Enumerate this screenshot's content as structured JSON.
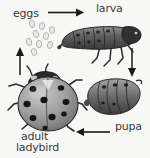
{
  "diagram": {
    "background_color": "#f7f7f5",
    "text_color": "#3a3a3a",
    "labels": {
      "eggs": "eggs",
      "larva": "larva",
      "pupa": "pupa",
      "adult_line1": "adult",
      "adult_line2": "ladybird"
    },
    "stages": [
      {
        "name": "eggs",
        "label": "eggs",
        "count": 9
      },
      {
        "name": "larva",
        "label": "larva"
      },
      {
        "name": "pupa",
        "label": "pupa"
      },
      {
        "name": "adult",
        "label": "adult ladybird"
      }
    ],
    "arrows": [
      {
        "name": "eggs-to-larva",
        "direction": "right"
      },
      {
        "name": "larva-to-pupa",
        "direction": "down"
      },
      {
        "name": "pupa-to-adult",
        "direction": "left"
      },
      {
        "name": "adult-to-eggs",
        "direction": "up"
      }
    ],
    "colors": {
      "arrow": "#1a1a1a",
      "body_dark": "#4a4a4a",
      "body_mid": "#8a8a8a",
      "body_light": "#bdbdbd",
      "spot": "#1c1c1c",
      "egg_fill": "#e6e6e4",
      "egg_stroke": "#a8a8a4"
    }
  }
}
